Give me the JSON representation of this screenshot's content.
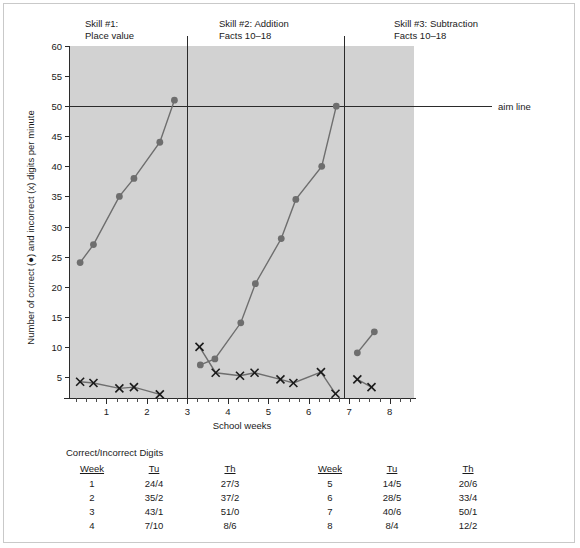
{
  "phases": [
    {
      "id": "skill1",
      "label": "Skill #1:\nPlace value",
      "left_px": 81,
      "top_px": 14
    },
    {
      "id": "skill2",
      "label": "Skill #2: Addition\nFacts 10–18",
      "left_px": 215,
      "top_px": 14
    },
    {
      "id": "skill3",
      "label": "Skill #3: Subtraction\nFacts 10–18",
      "left_px": 390,
      "top_px": 14
    }
  ],
  "aim": {
    "label": "aim line",
    "value": 50
  },
  "table": {
    "caption": "Correct/Incorrect Digits",
    "headers": [
      "Week",
      "Tu",
      "Th"
    ],
    "left_rows": [
      [
        "1",
        "24/4",
        "27/3"
      ],
      [
        "2",
        "35/2",
        "37/2"
      ],
      [
        "3",
        "43/1",
        "51/0"
      ],
      [
        "4",
        "7/10",
        "8/6"
      ]
    ],
    "right_rows": [
      [
        "5",
        "14/5",
        "20/6"
      ],
      [
        "6",
        "28/5",
        "33/4"
      ],
      [
        "7",
        "40/6",
        "50/1"
      ],
      [
        "8",
        "8/4",
        "12/2"
      ]
    ]
  },
  "chart_data": {
    "type": "line",
    "title": "",
    "xlabel": "School weeks",
    "ylabel": "Number of correct (●) and incorrect (x) digits per minute",
    "xlim": [
      0.1,
      8.6
    ],
    "ylim": [
      1.5,
      60
    ],
    "yticks": [
      5,
      10,
      15,
      20,
      25,
      30,
      35,
      40,
      45,
      50,
      55,
      60
    ],
    "xticks": [
      1,
      2,
      3,
      4,
      5,
      6,
      7,
      8
    ],
    "x_minor_per_major": 3,
    "grid": false,
    "legend": "none",
    "plot_bg": "#d2d2d2",
    "marker_color": "#6e6e6e",
    "x_marker_color": "#1a1a1a",
    "aim_line_y": 50,
    "phase_lines_x": [
      3.0,
      6.88
    ],
    "series": [
      {
        "name": "Correct digits per minute",
        "marker": "circle",
        "segments": [
          {
            "phase": "Skill #1: Place value",
            "x": [
              0.35,
              0.68,
              1.32,
              1.68,
              2.32,
              2.68
            ],
            "y": [
              24,
              27,
              35,
              38,
              44,
              51
            ]
          },
          {
            "phase": "Skill #2: Addition Facts 10-18",
            "x": [
              3.32,
              3.68,
              4.32,
              4.68,
              5.32,
              5.68,
              6.32,
              6.68
            ],
            "y": [
              7,
              8,
              14,
              20.5,
              28,
              34.5,
              40,
              50
            ]
          },
          {
            "phase": "Skill #3: Subtraction Facts 10-18",
            "x": [
              7.2,
              7.62
            ],
            "y": [
              9,
              12.5
            ]
          }
        ]
      },
      {
        "name": "Incorrect digits per minute",
        "marker": "x",
        "segments": [
          {
            "phase": "Skill #1: Place value",
            "x": [
              0.35,
              0.68,
              1.32,
              1.68,
              2.32
            ],
            "y": [
              4.2,
              4.0,
              3.1,
              3.3,
              2.1
            ]
          },
          {
            "phase": "Skill #2: Addition Facts 10-18",
            "x": [
              3.3,
              3.7,
              4.3,
              4.66,
              5.3,
              5.62,
              6.3,
              6.66
            ],
            "y": [
              10.0,
              5.7,
              5.2,
              5.7,
              4.6,
              4.0,
              5.8,
              2.2
            ]
          },
          {
            "phase": "Skill #3: Subtraction Facts 10-18",
            "x": [
              7.2,
              7.55
            ],
            "y": [
              4.6,
              3.3
            ]
          }
        ]
      }
    ]
  }
}
